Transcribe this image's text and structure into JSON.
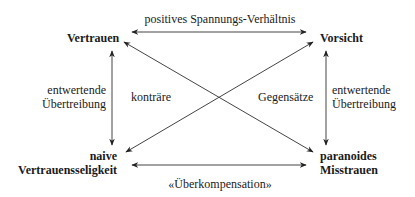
{
  "nodes": {
    "top_left": {
      "label": "Vertrauen"
    },
    "top_right": {
      "label": "Vorsicht"
    },
    "bottom_left": {
      "line1": "naive",
      "line2": "Vertrauensseligkeit"
    },
    "bottom_right": {
      "line1": "paranoides",
      "line2": "Misstrauen"
    }
  },
  "edges": {
    "top": {
      "label": "positives Spannungs-Verhältnis"
    },
    "bottom": {
      "label": "«Überkompensation»"
    },
    "left": {
      "line1": "entwertende",
      "line2": "Übertreibung"
    },
    "right": {
      "line1": "entwertende",
      "line2": "Übertreibung"
    },
    "diagonal_left_label": "konträre",
    "diagonal_right_label": "Gegensätze"
  },
  "colors": {
    "line": "#333333",
    "text": "#1a1a1a",
    "background": "#ffffff"
  }
}
